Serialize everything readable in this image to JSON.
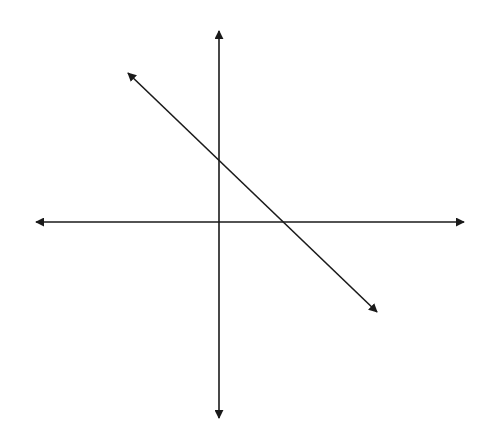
{
  "diagram": {
    "type": "coordinate-plane-with-line",
    "canvas": {
      "width": 484,
      "height": 448,
      "background": "#ffffff"
    },
    "stroke_color": "#1a1a1a",
    "origin": {
      "x": 219,
      "y": 222
    },
    "axes": {
      "x_axis": {
        "x1": 36,
        "y1": 222,
        "x2": 464,
        "y2": 222,
        "arrows": "both"
      },
      "y_axis": {
        "x1": 219,
        "y1": 31,
        "x2": 219,
        "y2": 418,
        "arrows": "both"
      }
    },
    "line": {
      "x1": 128,
      "y1": 73,
      "x2": 377,
      "y2": 312,
      "arrows": "both",
      "slope": "negative",
      "y_intercept_px": {
        "x": 219,
        "y": 161
      },
      "x_intercept_px": {
        "x": 282,
        "y": 222
      }
    }
  }
}
